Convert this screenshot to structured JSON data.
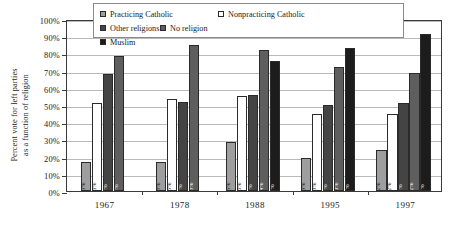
{
  "chart_data": {
    "type": "bar",
    "title": "",
    "xlabel": "",
    "ylabel": "Percent vote for left parties as a function of religion",
    "ylabel_line1": "Percent vote for left parties",
    "ylabel_line2": "as a function of religion",
    "ylim": [
      0,
      100
    ],
    "ytick_labels": [
      "100%",
      "90%",
      "80%",
      "70%",
      "60%",
      "50%",
      "40%",
      "30%",
      "20%",
      "10%",
      "0%"
    ],
    "ytick_values": [
      100,
      90,
      80,
      70,
      60,
      50,
      40,
      30,
      20,
      10,
      0
    ],
    "grid": true,
    "legend_position": "top-inside",
    "categories": [
      "1967",
      "1978",
      "1988",
      "1995",
      "1997"
    ],
    "series": [
      {
        "name": "Practicing Catholic",
        "color": "#9e9e9e",
        "values": [
          17,
          17,
          28.5,
          19,
          24
        ],
        "data_labels": [
          "25%",
          "18%",
          "15%",
          "13%",
          "12%"
        ],
        "label_color": "dark"
      },
      {
        "name": "Nonpracticing Catholic",
        "color": "#ffffff",
        "values": [
          51,
          53.5,
          55,
          45,
          45
        ],
        "data_labels": [
          "66%",
          "65%",
          "66%",
          "63%",
          "62%"
        ],
        "label_color": "dark"
      },
      {
        "name": "Other religions",
        "color": "#444444",
        "values": [
          68,
          52,
          56,
          50,
          51
        ],
        "data_labels": [
          "3%",
          "4%",
          "4%",
          "4%",
          "4%"
        ],
        "label_color": "light"
      },
      {
        "name": "No religion",
        "color": "#5e5e5e",
        "values": [
          78.5,
          85,
          82,
          72,
          68.5
        ],
        "data_labels": [
          "6%",
          "13%",
          "14%",
          "20%",
          "22%"
        ],
        "label_color": "light"
      },
      {
        "name": "Muslim",
        "color": "#1c1c1c",
        "values": [
          null,
          null,
          75.5,
          83,
          91
        ],
        "data_labels": [
          "",
          "",
          "1%",
          "1%",
          "1%"
        ],
        "label_color": "light"
      }
    ]
  }
}
